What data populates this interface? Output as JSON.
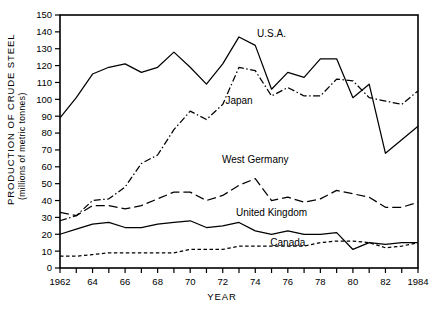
{
  "chart_data": {
    "type": "line",
    "title": "",
    "xlabel": "YEAR",
    "ylabel": "PRODUCTION OF CRUDE STEEL",
    "ylabel_sub": "(millions of metric tonnes)",
    "xlim": [
      1962,
      1984
    ],
    "ylim": [
      0,
      150
    ],
    "ytick_step": 10,
    "xtick_step": 1,
    "grid": false,
    "legend": "inline-labels",
    "yticks": [
      0,
      10,
      20,
      30,
      40,
      50,
      60,
      70,
      80,
      90,
      100,
      110,
      120,
      130,
      140,
      150
    ],
    "ytick_labels": [
      "0",
      "10",
      "20",
      "30",
      "40",
      "50",
      "60",
      "70",
      "80",
      "90",
      "100",
      "110",
      "120",
      "130",
      "140",
      "150"
    ],
    "xticks": [
      1962,
      1963,
      1964,
      1965,
      1966,
      1967,
      1968,
      1969,
      1970,
      1971,
      1972,
      1973,
      1974,
      1975,
      1976,
      1977,
      1978,
      1979,
      1980,
      1981,
      1982,
      1983,
      1984
    ],
    "xtick_labels": [
      "1962",
      "",
      "64",
      "",
      "66",
      "",
      "68",
      "",
      "70",
      "",
      "72",
      "",
      "74",
      "",
      "76",
      "",
      "78",
      "",
      "80",
      "",
      "82",
      "",
      "1984"
    ],
    "x": [
      1962,
      1963,
      1964,
      1965,
      1966,
      1967,
      1968,
      1969,
      1970,
      1971,
      1972,
      1973,
      1974,
      1975,
      1976,
      1977,
      1978,
      1979,
      1980,
      1981,
      1982,
      1983,
      1984
    ],
    "series": [
      {
        "name": "U.S.A.",
        "line_style": "solid",
        "color": "#000000",
        "label_x": 1975,
        "label_y": 137,
        "values": [
          89,
          101,
          115,
          119,
          121,
          116,
          119,
          128,
          119,
          109,
          121,
          137,
          132,
          106,
          116,
          113,
          124,
          124,
          101,
          109,
          68,
          76,
          84
        ]
      },
      {
        "name": "Japan",
        "line_style": "dash-dot",
        "color": "#000000",
        "label_x": 1973,
        "label_y": 97,
        "values": [
          28,
          31,
          40,
          41,
          48,
          62,
          67,
          82,
          93,
          88,
          97,
          119,
          117,
          102,
          107,
          102,
          102,
          112,
          111,
          101,
          99,
          97,
          105
        ]
      },
      {
        "name": "West Germany",
        "line_style": "long-dash",
        "color": "#000000",
        "label_x": 1974,
        "label_y": 62,
        "values": [
          33,
          31,
          37,
          37,
          35,
          37,
          41,
          45,
          45,
          40,
          43,
          49,
          53,
          40,
          42,
          39,
          41,
          46,
          44,
          42,
          36,
          36,
          39
        ]
      },
      {
        "name": "United Kingdom",
        "line_style": "solid",
        "color": "#000000",
        "label_x": 1975,
        "label_y": 31,
        "values": [
          20,
          23,
          26,
          27,
          24,
          24,
          26,
          27,
          28,
          24,
          25,
          27,
          22,
          20,
          22,
          20,
          20,
          21,
          11,
          15,
          14,
          15,
          15
        ]
      },
      {
        "name": "Canada",
        "line_style": "short-dash",
        "color": "#000000",
        "label_x": 1976,
        "label_y": 13,
        "values": [
          7,
          7,
          8,
          9,
          9,
          9,
          9,
          9,
          11,
          11,
          11,
          13,
          13,
          13,
          13,
          13,
          15,
          16,
          16,
          15,
          12,
          13,
          15
        ]
      }
    ]
  },
  "axis": {
    "y_title_line1": "PRODUCTION  OF  CRUDE  STEEL",
    "y_title_line2": "(millions  of  metric  tonnes)",
    "x_title": "YEAR"
  }
}
